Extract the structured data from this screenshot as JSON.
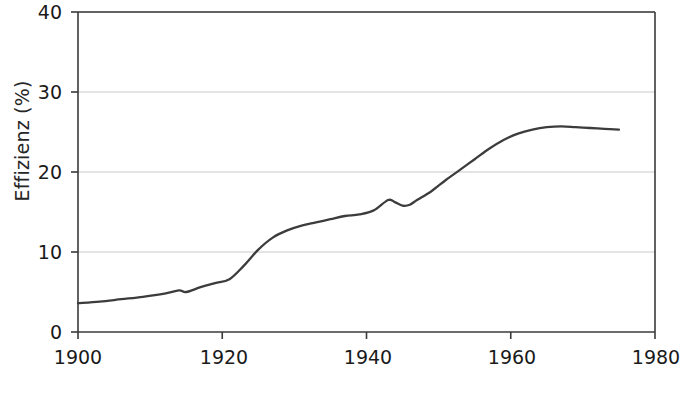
{
  "figure": {
    "background": "#ffffff",
    "axis_color": "#3a3a3a",
    "grid_color": "#c8c8c8",
    "line_color": "#3c3c3c"
  },
  "chart_data": {
    "type": "line",
    "title": "",
    "xlabel": "",
    "ylabel": "Effizienz (%)",
    "xlim": [
      1900,
      1980
    ],
    "ylim": [
      0,
      40
    ],
    "xticks": [
      1900,
      1920,
      1940,
      1960,
      1980
    ],
    "yticks": [
      0,
      10,
      20,
      30,
      40
    ],
    "xtick_labels": [
      "1900",
      "1920",
      "1940",
      "1960",
      "1980"
    ],
    "ytick_labels": [
      "0",
      "10",
      "20",
      "30",
      "40"
    ],
    "grid": "horizontal",
    "legend": "none",
    "series": [
      {
        "name": "Effizienz",
        "x": [
          1900,
          1903,
          1906,
          1909,
          1912,
          1914,
          1915,
          1917,
          1919,
          1921,
          1923,
          1925,
          1927,
          1929,
          1931,
          1933,
          1935,
          1937,
          1939,
          1941,
          1943,
          1944,
          1945,
          1946,
          1947,
          1949,
          1951,
          1953,
          1955,
          1957,
          1959,
          1961,
          1963,
          1965,
          1967,
          1969,
          1971,
          1973,
          1975
        ],
        "y": [
          3.6,
          3.8,
          4.1,
          4.4,
          4.8,
          5.2,
          5.0,
          5.6,
          6.1,
          6.6,
          8.3,
          10.3,
          11.8,
          12.7,
          13.3,
          13.7,
          14.1,
          14.5,
          14.7,
          15.2,
          16.5,
          16.2,
          15.8,
          15.9,
          16.5,
          17.6,
          19.0,
          20.3,
          21.6,
          22.9,
          24.0,
          24.8,
          25.3,
          25.6,
          25.7,
          25.6,
          25.5,
          25.4,
          25.3
        ]
      }
    ]
  }
}
